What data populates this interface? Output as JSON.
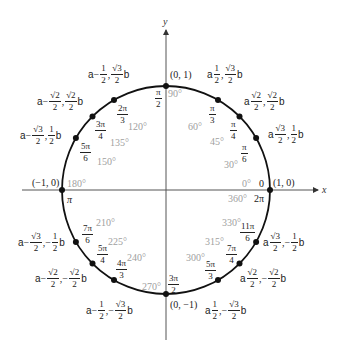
{
  "diagram": {
    "axes": {
      "x_label": "x",
      "y_label": "y"
    },
    "center_px": [
      166,
      190
    ],
    "radius_px": 104,
    "colors": {
      "circle": "#111111",
      "axes": "#555555",
      "degrees": "#a0a0a0",
      "text": "#222222"
    },
    "axis_points": {
      "top": "(0, 1)",
      "bottom": "(0, −1)",
      "left": "(−1, 0)",
      "right": "(1, 0)"
    },
    "radians_special": {
      "zero": "0",
      "two_pi": "2π",
      "pi": "π"
    },
    "points": [
      {
        "deg": "0°",
        "rad_num": "0",
        "rad_den": "",
        "cx": "1",
        "cy": "0"
      },
      {
        "deg": "30°",
        "rad_num": "π",
        "rad_den": "6",
        "x": "√3/2",
        "y": "1/2"
      },
      {
        "deg": "45°",
        "rad_num": "π",
        "rad_den": "4",
        "x": "√2/2",
        "y": "√2/2"
      },
      {
        "deg": "60°",
        "rad_num": "π",
        "rad_den": "3",
        "x": "1/2",
        "y": "√3/2"
      },
      {
        "deg": "90°",
        "rad_num": "π",
        "rad_den": "2",
        "x": "0",
        "y": "1"
      },
      {
        "deg": "120°",
        "rad_num": "2π",
        "rad_den": "3",
        "x": "−1/2",
        "y": "√3/2"
      },
      {
        "deg": "135°",
        "rad_num": "3π",
        "rad_den": "4",
        "x": "−√2/2",
        "y": "√2/2"
      },
      {
        "deg": "150°",
        "rad_num": "5π",
        "rad_den": "6",
        "x": "−√3/2",
        "y": "1/2"
      },
      {
        "deg": "180°",
        "rad_num": "π",
        "rad_den": "",
        "x": "−1",
        "y": "0"
      },
      {
        "deg": "210°",
        "rad_num": "7π",
        "rad_den": "6",
        "x": "−√3/2",
        "y": "−1/2"
      },
      {
        "deg": "225°",
        "rad_num": "5π",
        "rad_den": "4",
        "x": "−√2/2",
        "y": "−√2/2"
      },
      {
        "deg": "240°",
        "rad_num": "4π",
        "rad_den": "3",
        "x": "−1/2",
        "y": "−√3/2"
      },
      {
        "deg": "270°",
        "rad_num": "3π",
        "rad_den": "2",
        "x": "0",
        "y": "−1"
      },
      {
        "deg": "300°",
        "rad_num": "5π",
        "rad_den": "3",
        "x": "1/2",
        "y": "−√3/2"
      },
      {
        "deg": "315°",
        "rad_num": "7π",
        "rad_den": "4",
        "x": "√2/2",
        "y": "−√2/2"
      },
      {
        "deg": "330°",
        "rad_num": "11π",
        "rad_den": "6",
        "x": "√3/2",
        "y": "−1/2"
      },
      {
        "deg": "360°",
        "rad_num": "2π",
        "rad_den": "",
        "x": "1",
        "y": "0"
      }
    ],
    "coord_paren_left": "a",
    "coord_paren_right": "b",
    "sqrt2": "√2",
    "sqrt3": "√3",
    "one": "1",
    "two": "2",
    "minus": "−",
    "comma": ","
  }
}
